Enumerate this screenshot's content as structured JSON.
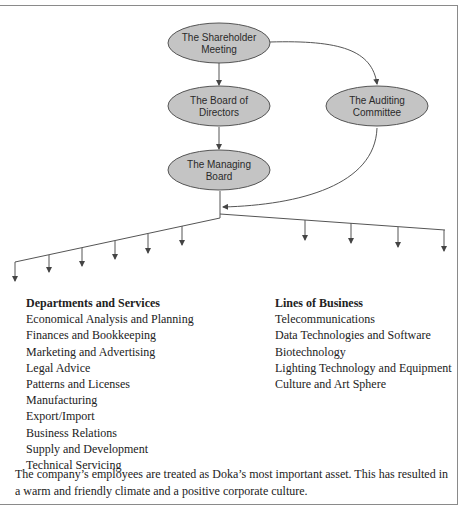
{
  "diagram": {
    "nodes": [
      {
        "id": "shareholder",
        "label_line1": "The Shareholder",
        "label_line2": "Meeting"
      },
      {
        "id": "board-of-directors",
        "label_line1": "The Board of",
        "label_line2": "Directors"
      },
      {
        "id": "managing-board",
        "label_line1": "The Managing",
        "label_line2": "Board"
      },
      {
        "id": "auditing-committee",
        "label_line1": "The Auditing",
        "label_line2": "Committee"
      }
    ],
    "edges": [
      {
        "from": "shareholder",
        "to": "board-of-directors"
      },
      {
        "from": "board-of-directors",
        "to": "managing-board"
      },
      {
        "from": "shareholder",
        "to": "auditing-committee"
      },
      {
        "from": "auditing-committee",
        "to": "managing-board-output"
      }
    ],
    "left_branch_arrow_count": 6,
    "right_branch_arrow_count": 4,
    "node_fill": "#c4c4c4",
    "line_color": "#555555"
  },
  "departments": {
    "heading": "Departments and Services",
    "items": [
      "Economical Analysis and Planning",
      "Finances and Bookkeeping",
      "Marketing and Advertising",
      "Legal Advice",
      "Patterns and Licenses",
      "Manufacturing",
      "Export/Import",
      "Business Relations",
      "Supply and Development",
      "Technical Servicing"
    ]
  },
  "lines_of_business": {
    "heading": "Lines of Business",
    "items": [
      "Telecommunications",
      "Data Technologies and Software",
      "Biotechnology",
      "Lighting Technology and Equipment",
      "Culture and Art Sphere"
    ]
  },
  "footer": {
    "text": "The company’s employees are treated as Doka’s most important asset. This has resulted in a warm and friendly climate and a positive corporate culture."
  }
}
